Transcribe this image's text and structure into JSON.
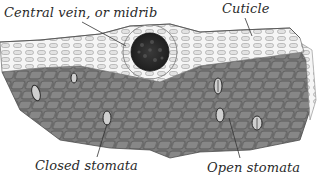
{
  "figure": {
    "labels": {
      "midrib": "Central vein, or midrib",
      "cuticle": "Cuticle",
      "closed_stomata": "Closed stomata",
      "open_stomata": "Open stomata"
    },
    "colors": {
      "background": "#ffffff",
      "epidermis": "#f4f4f4",
      "cell_outline": "#8a8a8a",
      "leaf_body": "#8c8c8c",
      "leaf_body_dark": "#5e5e5e",
      "vein": "#2e2e2e",
      "label_text": "#2a2a2a"
    }
  }
}
